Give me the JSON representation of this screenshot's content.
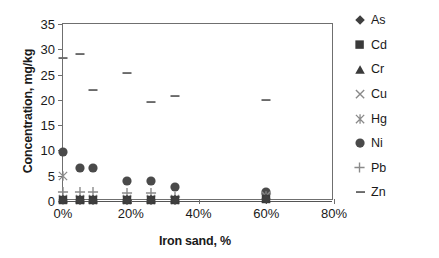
{
  "chart_data": {
    "type": "scatter",
    "title": "",
    "xlabel": "Iron sand, %",
    "ylabel": "Concentration, mg/kg",
    "xlim": [
      0,
      80
    ],
    "ylim": [
      0,
      35
    ],
    "xticks": [
      "0%",
      "20%",
      "40%",
      "60%",
      "80%"
    ],
    "xtick_values": [
      0,
      20,
      40,
      60,
      80
    ],
    "yticks": [
      "0",
      "5",
      "10",
      "15",
      "20",
      "25",
      "30",
      "35"
    ],
    "ytick_values": [
      0,
      5,
      10,
      15,
      20,
      25,
      30,
      35
    ],
    "grid": false,
    "legend_position": "right",
    "x": [
      0,
      5,
      9,
      19,
      26,
      33,
      60
    ],
    "series": [
      {
        "name": "As",
        "marker": "diamond",
        "color": "#3f3f3f",
        "values": [
          0.2,
          0.2,
          0.2,
          0.2,
          0.2,
          0.2,
          0.4
        ]
      },
      {
        "name": "Cd",
        "marker": "square",
        "color": "#3a3a3a",
        "values": [
          0.1,
          0.1,
          0.1,
          0.1,
          0.1,
          0.1,
          0.3
        ]
      },
      {
        "name": "Cr",
        "marker": "triangle",
        "color": "#3a3a3a",
        "values": [
          0.3,
          0.3,
          0.3,
          0.3,
          0.3,
          0.3,
          0.6
        ]
      },
      {
        "name": "Cu",
        "marker": "cross",
        "color": "#8a8a8a",
        "values": [
          0.3,
          0.3,
          0.3,
          0.3,
          0.3,
          0.3,
          1.0
        ]
      },
      {
        "name": "Hg",
        "marker": "star",
        "color": "#8a8a8a",
        "values": [
          5.0,
          0.2,
          0.2,
          0.2,
          0.2,
          0.2,
          0.9
        ]
      },
      {
        "name": "Ni",
        "marker": "circle",
        "color": "#4a4a4a",
        "values": [
          9.7,
          6.5,
          6.6,
          3.9,
          3.9,
          2.7,
          1.8
        ]
      },
      {
        "name": "Pb",
        "marker": "plus",
        "color": "#8a8a8a",
        "values": [
          1.7,
          1.8,
          1.8,
          1.6,
          1.6,
          0.7,
          1.4
        ]
      },
      {
        "name": "Zn",
        "marker": "dash",
        "color": "#6a6a6a",
        "values": [
          28.3,
          29.0,
          21.9,
          25.3,
          19.6,
          20.7,
          19.9
        ]
      }
    ]
  }
}
